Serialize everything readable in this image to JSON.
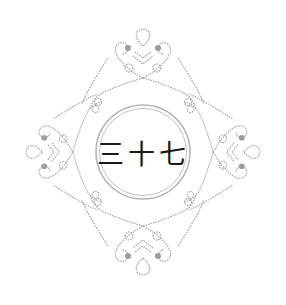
{
  "emblem": {
    "text": "三十七",
    "ornament_color": "#a8a8a8",
    "ornament_dark": "#9a9a9a",
    "ring_color": "#b5b5b5",
    "text_color": "#1a1a1a",
    "background": "#ffffff"
  }
}
